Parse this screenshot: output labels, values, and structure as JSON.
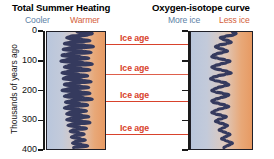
{
  "figure": {
    "width": 274,
    "height": 159,
    "background": "#ffffff"
  },
  "titles": {
    "left": "Total Summer Heating",
    "right": "Oxygen-isotope curve"
  },
  "axis_direction_labels": {
    "left_low": "Cooler",
    "left_high": "Warmer",
    "right_low": "More ice",
    "right_high": "Less ice"
  },
  "colors": {
    "cool": "#5b7fa6",
    "warm": "#d4603a",
    "ice_age_red": "#d8422c",
    "curve": "#353a5e",
    "axis": "#1a1a1a",
    "gradient_cold": "#b9c6dc",
    "gradient_warm": "#e79a63"
  },
  "y_axis": {
    "label": "Thousands of years ago",
    "ticks": [
      0,
      100,
      200,
      300,
      400
    ],
    "tick_labels": [
      "0",
      "100",
      "200",
      "300",
      "400"
    ],
    "range": [
      0,
      400
    ],
    "direction": "increasing-downward"
  },
  "ice_ages": {
    "label": "Ice age",
    "count": 4,
    "depths_kyr": [
      45,
      145,
      235,
      345
    ]
  },
  "chart_data": {
    "type": "line",
    "xlabel": "",
    "ylabel": "Thousands of years ago",
    "ylim": [
      0,
      400
    ],
    "grid": false,
    "legend": null,
    "annotations": [
      "Ice age",
      "Ice age",
      "Ice age",
      "Ice age"
    ],
    "panels": [
      {
        "name": "total-summer-heating",
        "title": "Total Summer Heating",
        "x_low_label": "Cooler",
        "x_high_label": "Warmer",
        "orientation": "x-is-value, y-is-age-downward",
        "x": [
          0.52,
          0.78,
          0.7,
          0.4,
          0.34,
          0.6,
          0.74,
          0.38,
          0.3,
          0.66,
          0.8,
          0.36,
          0.28,
          0.62,
          0.76,
          0.34,
          0.26,
          0.58,
          0.72,
          0.32,
          0.24,
          0.64,
          0.78,
          0.36,
          0.3,
          0.6,
          0.74,
          0.34,
          0.26,
          0.56,
          0.7,
          0.32,
          0.28,
          0.62,
          0.76,
          0.38,
          0.3,
          0.58,
          0.72,
          0.34,
          0.26,
          0.6,
          0.74,
          0.36,
          0.3,
          0.64,
          0.78,
          0.4,
          0.32,
          0.58,
          0.7,
          0.36,
          0.3,
          0.56,
          0.68,
          0.38,
          0.34,
          0.6,
          0.72,
          0.4,
          0.34,
          0.62,
          0.74,
          0.42,
          0.36,
          0.58,
          0.68,
          0.44,
          0.4,
          0.56,
          0.64,
          0.46,
          0.42,
          0.58,
          0.66,
          0.48,
          0.44,
          0.6,
          0.7,
          0.46
        ],
        "y": [
          0,
          5,
          10,
          15,
          20,
          25,
          30,
          35,
          40,
          45,
          50,
          55,
          60,
          65,
          70,
          75,
          80,
          85,
          90,
          95,
          100,
          105,
          110,
          115,
          120,
          125,
          130,
          135,
          140,
          145,
          150,
          155,
          160,
          165,
          170,
          175,
          180,
          185,
          190,
          195,
          200,
          205,
          210,
          215,
          220,
          225,
          230,
          235,
          240,
          245,
          250,
          255,
          260,
          265,
          270,
          275,
          280,
          285,
          290,
          295,
          300,
          305,
          310,
          315,
          320,
          325,
          330,
          335,
          340,
          345,
          350,
          355,
          360,
          365,
          370,
          375,
          380,
          385,
          390,
          395
        ]
      },
      {
        "name": "oxygen-isotope-curve",
        "title": "Oxygen-isotope curve",
        "x_low_label": "More ice",
        "x_high_label": "Less ice",
        "orientation": "x-is-value, y-is-age-downward",
        "x": [
          0.68,
          0.74,
          0.7,
          0.56,
          0.48,
          0.52,
          0.62,
          0.66,
          0.58,
          0.46,
          0.4,
          0.44,
          0.54,
          0.6,
          0.52,
          0.42,
          0.36,
          0.34,
          0.44,
          0.56,
          0.64,
          0.58,
          0.48,
          0.4,
          0.34,
          0.38,
          0.5,
          0.6,
          0.66,
          0.56,
          0.44,
          0.36,
          0.32,
          0.38,
          0.48,
          0.58,
          0.62,
          0.54,
          0.44,
          0.38,
          0.34,
          0.4,
          0.52,
          0.62,
          0.58,
          0.48,
          0.4,
          0.34,
          0.36,
          0.46,
          0.56,
          0.62,
          0.54,
          0.44,
          0.38,
          0.34,
          0.4,
          0.5,
          0.58,
          0.52,
          0.44,
          0.4,
          0.46,
          0.54,
          0.6,
          0.56,
          0.5,
          0.46,
          0.52,
          0.58,
          0.64,
          0.6,
          0.54,
          0.5,
          0.56,
          0.62,
          0.68,
          0.64,
          0.58,
          0.54
        ],
        "y": [
          0,
          5,
          10,
          15,
          20,
          25,
          30,
          35,
          40,
          45,
          50,
          55,
          60,
          65,
          70,
          75,
          80,
          85,
          90,
          95,
          100,
          105,
          110,
          115,
          120,
          125,
          130,
          135,
          140,
          145,
          150,
          155,
          160,
          165,
          170,
          175,
          180,
          185,
          190,
          195,
          200,
          205,
          210,
          215,
          220,
          225,
          230,
          235,
          240,
          245,
          250,
          255,
          260,
          265,
          270,
          275,
          280,
          285,
          290,
          295,
          300,
          305,
          310,
          315,
          320,
          325,
          330,
          335,
          340,
          345,
          350,
          355,
          360,
          365,
          370,
          375,
          380,
          385,
          390,
          395
        ]
      }
    ]
  }
}
